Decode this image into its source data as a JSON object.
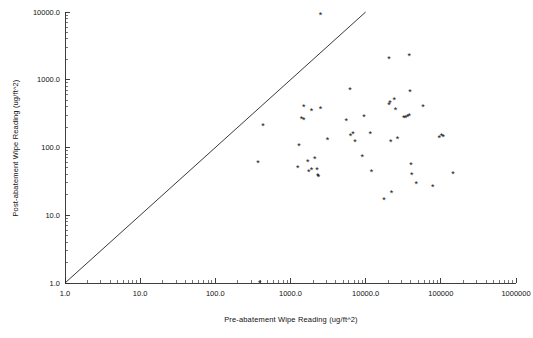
{
  "figure": {
    "background_color": "#ffffff",
    "foreground_color": "#111111",
    "marker_symbol": "*",
    "marker_color": "#111111",
    "reference_line_color": "#222222"
  },
  "axes": {
    "x": {
      "title": "Pre-abatement Wipe Reading (ug/ft^2)",
      "tick_labels": [
        "1.0",
        "10.0",
        "100.0",
        "1000.0",
        "10000.0",
        "100000",
        "1000000"
      ],
      "tick_values": [
        1,
        10,
        100,
        1000,
        10000,
        100000,
        1000000
      ],
      "scale": "log",
      "range": [
        1,
        1000000
      ]
    },
    "y": {
      "title": "Post-abatement Wipe Reading (ug/ft^2)",
      "tick_labels": [
        "1.0",
        "10.0",
        "100.0",
        "1000.0",
        "10000.0"
      ],
      "tick_values": [
        1,
        10,
        100,
        1000,
        10000
      ],
      "scale": "log",
      "range": [
        1,
        10000
      ]
    }
  },
  "chart_data": {
    "type": "scatter",
    "title": "",
    "xlabel": "Pre-abatement Wipe Reading (ug/ft^2)",
    "ylabel": "Post-abatement Wipe Reading (ug/ft^2)",
    "xscale": "log",
    "yscale": "log",
    "xlim": [
      1,
      1000000
    ],
    "ylim": [
      1,
      10000
    ],
    "grid": false,
    "legend": "none",
    "annotations": [
      {
        "name": "identity-reference-line",
        "description": "diagonal line y = x drawn from (1,1) to (10000,10000)",
        "x_start": 1,
        "y_start": 1,
        "x_end": 10000,
        "y_end": 10000
      }
    ],
    "series": [
      {
        "name": "wipe readings",
        "marker": "*",
        "points": [
          [
            2500,
            9000
          ],
          [
            390,
            1.0
          ],
          [
            370,
            60
          ],
          [
            430,
            210
          ],
          [
            1500,
            390
          ],
          [
            1400,
            265
          ],
          [
            1500,
            255
          ],
          [
            1900,
            340
          ],
          [
            2500,
            375
          ],
          [
            1300,
            105
          ],
          [
            1250,
            50
          ],
          [
            1700,
            62
          ],
          [
            1900,
            46
          ],
          [
            1750,
            44
          ],
          [
            2100,
            67
          ],
          [
            2250,
            47
          ],
          [
            2300,
            38
          ],
          [
            2350,
            37
          ],
          [
            3100,
            130
          ],
          [
            5500,
            250
          ],
          [
            6200,
            700
          ],
          [
            6300,
            150
          ],
          [
            6800,
            160
          ],
          [
            7200,
            120
          ],
          [
            9500,
            280
          ],
          [
            9000,
            73
          ],
          [
            11500,
            160
          ],
          [
            12000,
            43
          ],
          [
            17500,
            17
          ],
          [
            20500,
            2050
          ],
          [
            21000,
            450
          ],
          [
            20500,
            420
          ],
          [
            21500,
            120
          ],
          [
            22000,
            21
          ],
          [
            24000,
            500
          ],
          [
            25000,
            360
          ],
          [
            26500,
            135
          ],
          [
            32000,
            270
          ],
          [
            34000,
            275
          ],
          [
            36000,
            280
          ],
          [
            38000,
            290
          ],
          [
            38000,
            2250
          ],
          [
            39000,
            650
          ],
          [
            40000,
            55
          ],
          [
            41000,
            39
          ],
          [
            47000,
            29
          ],
          [
            58000,
            400
          ],
          [
            78000,
            26
          ],
          [
            95000,
            140
          ],
          [
            102000,
            150
          ],
          [
            108000,
            145
          ],
          [
            145000,
            41
          ]
        ]
      }
    ]
  }
}
